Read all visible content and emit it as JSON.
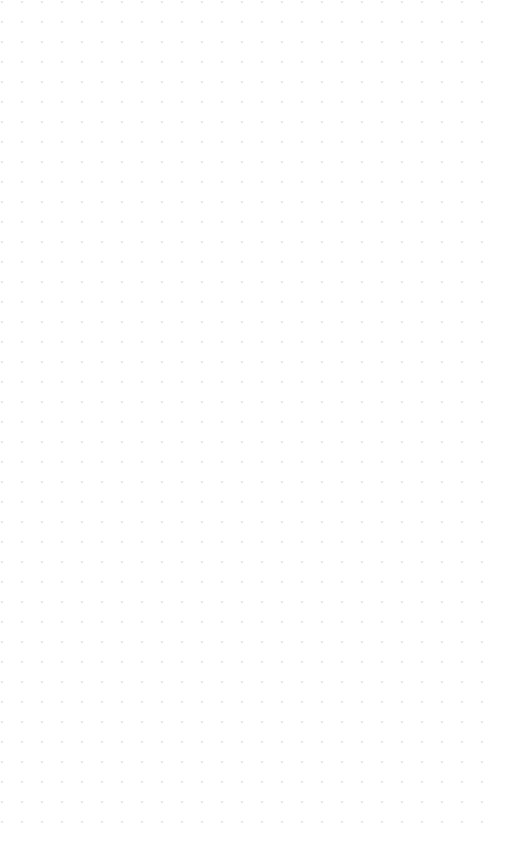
{
  "page": {
    "width": 507,
    "height": 865
  },
  "canvas": {
    "name": "dot-grid-canvas",
    "background_color": "#ffffff",
    "content": "",
    "is_empty": true,
    "annotations": [],
    "text_items": []
  },
  "grid": {
    "style": "dot",
    "dot_color": "#b6b6bd",
    "dot_diameter_px": 1.2,
    "spacing_x_px": 20,
    "spacing_y_px": 20,
    "origin_x_px": 22,
    "origin_y_px": 22,
    "columns": 24,
    "rows": 41,
    "first_dot_x_px": 22,
    "first_dot_y_px": 22,
    "last_dot_x_px": 482,
    "last_dot_y_px": 822,
    "margin_right_px": 25,
    "margin_bottom_px": 43
  }
}
